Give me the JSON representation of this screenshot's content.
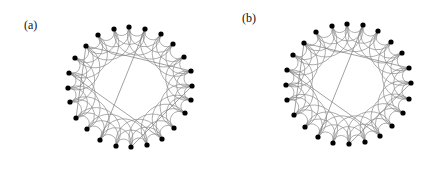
{
  "figure": {
    "width": 447,
    "height": 171,
    "colors": {
      "background": "#ffffff",
      "node": "#000000",
      "arc": "#8a8a8a",
      "chord": "#7a7a7a",
      "label": "#111111"
    },
    "arc_steps": [
      1,
      2,
      3
    ],
    "node_radius": 2.6,
    "panels": [
      {
        "id": "a",
        "label": "(a)",
        "label_pos": [
          24,
          29
        ],
        "node_count": 24,
        "nodes": [
          [
            98,
            35
          ],
          [
            114,
            29
          ],
          [
            129,
            27
          ],
          [
            145,
            29
          ],
          [
            161,
            34
          ],
          [
            173,
            44
          ],
          [
            184,
            57
          ],
          [
            191,
            71
          ],
          [
            192,
            86
          ],
          [
            191,
            100
          ],
          [
            185,
            113
          ],
          [
            174,
            128
          ],
          [
            162,
            139
          ],
          [
            147,
            145
          ],
          [
            131,
            147
          ],
          [
            116,
            146
          ],
          [
            100,
            140
          ],
          [
            87,
            129
          ],
          [
            76,
            118
          ],
          [
            70,
            102
          ],
          [
            68,
            88
          ],
          [
            69,
            73
          ],
          [
            75,
            58
          ],
          [
            86,
            46
          ]
        ],
        "shortcuts": [
          [
            23,
            7
          ],
          [
            23,
            18
          ],
          [
            3,
            16
          ],
          [
            21,
            12
          ],
          [
            14,
            8
          ]
        ]
      },
      {
        "id": "b",
        "label": "(b)",
        "label_pos": [
          242,
          22
        ],
        "node_count": 24,
        "nodes": [
          [
            316,
            32
          ],
          [
            332,
            26
          ],
          [
            347,
            24
          ],
          [
            363,
            25
          ],
          [
            378,
            31
          ],
          [
            391,
            42
          ],
          [
            402,
            53
          ],
          [
            409,
            68
          ],
          [
            411,
            83
          ],
          [
            409,
            99
          ],
          [
            403,
            113
          ],
          [
            392,
            126
          ],
          [
            380,
            136
          ],
          [
            365,
            142
          ],
          [
            349,
            144
          ],
          [
            333,
            143
          ],
          [
            318,
            137
          ],
          [
            305,
            127
          ],
          [
            294,
            115
          ],
          [
            287,
            100
          ],
          [
            286,
            85
          ],
          [
            287,
            70
          ],
          [
            293,
            55
          ],
          [
            304,
            43
          ]
        ],
        "shortcuts": [
          [
            23,
            7
          ],
          [
            23,
            18
          ],
          [
            3,
            16
          ],
          [
            21,
            12
          ],
          [
            14,
            8
          ]
        ]
      }
    ]
  }
}
